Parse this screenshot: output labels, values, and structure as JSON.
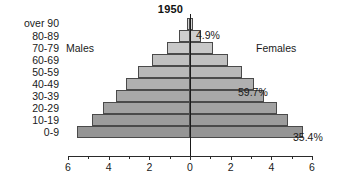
{
  "chart_data": {
    "type": "bar",
    "title": "1950",
    "subtitle": "",
    "xlabel": "",
    "ylabel": "",
    "orientation": "horizontal-diverging",
    "xlim": [
      -6,
      6
    ],
    "grid": false,
    "legend_position": "inline",
    "axis_display_note": "x tick labels show absolute value on both sides",
    "categories": [
      "over 90",
      "80-89",
      "70-79",
      "60-69",
      "50-59",
      "40-49",
      "30-39",
      "20-29",
      "10-19",
      "0-9"
    ],
    "x_ticks": [
      -6,
      -4,
      -2,
      0,
      2,
      4,
      6
    ],
    "x_tick_labels": [
      "6",
      "4",
      "2",
      "0",
      "2",
      "4",
      "6"
    ],
    "x_minor_ticks": [
      -5,
      -3,
      -1,
      1,
      3,
      5
    ],
    "series": [
      {
        "name": "Males",
        "side": "left",
        "values": [
          0.15,
          0.55,
          1.15,
          1.85,
          2.55,
          3.15,
          3.65,
          4.3,
          4.8,
          5.55
        ]
      },
      {
        "name": "Females",
        "side": "right",
        "values": [
          0.15,
          0.55,
          1.15,
          1.85,
          2.55,
          3.15,
          3.65,
          4.3,
          4.8,
          5.55
        ]
      }
    ],
    "bar_fills": [
      "#d6d6d6",
      "#cfcfcf",
      "#c8c8c8",
      "#c0c0c0",
      "#b8b8b8",
      "#b0b0b0",
      "#a8a8a8",
      "#a2a2a2",
      "#9c9c9c",
      "#959595"
    ],
    "bar_outline_color": "#4a4a4a",
    "annotations": [
      {
        "id": "top",
        "text": "4.9%",
        "refers_to": "over 90 / 80-89 apex"
      },
      {
        "id": "mid",
        "text": "59.7%",
        "refers_to": "40-49 band"
      },
      {
        "id": "bottom",
        "text": "35.4%",
        "refers_to": "0-9 band"
      }
    ]
  },
  "captions": {
    "males": "Males",
    "females": "Females"
  }
}
